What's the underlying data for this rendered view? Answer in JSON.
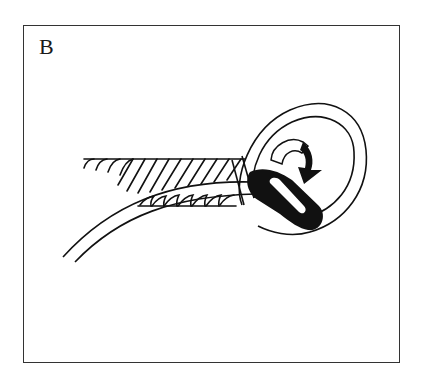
{
  "figure": {
    "panel_label": "B",
    "colors": {
      "ink": "#111111",
      "frame": "#333333",
      "background": "#ffffff"
    },
    "elements": [
      {
        "name": "twisted-rope-standing-part",
        "description": "laid rope with diagonal twist strands"
      },
      {
        "name": "rope-loop",
        "description": "white rope forming a loop around the working end"
      },
      {
        "name": "working-end",
        "description": "black-shaded rope end with highlight"
      },
      {
        "name": "tail-strand",
        "description": "white rope strand trailing down-left"
      },
      {
        "name": "turn-arrow",
        "description": "curved arrow indicating rotation"
      }
    ]
  }
}
